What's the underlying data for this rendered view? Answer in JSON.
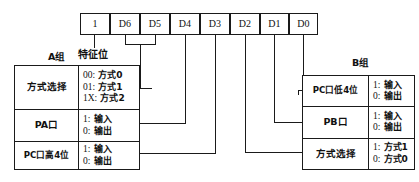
{
  "diagram": {
    "title_note": "8255A control word format diagram",
    "control_word": {
      "name": "control-word-bits",
      "cells": [
        {
          "id": "bit7",
          "label": "1"
        },
        {
          "id": "bit6",
          "label": "D6"
        },
        {
          "id": "bit5",
          "label": "D5"
        },
        {
          "id": "bit4",
          "label": "D4"
        },
        {
          "id": "bit3",
          "label": "D3"
        },
        {
          "id": "bit2",
          "label": "D2"
        },
        {
          "id": "bit1",
          "label": "D1"
        },
        {
          "id": "bit0",
          "label": "D0"
        }
      ]
    },
    "feature_bit_label": "特征位",
    "group_a": {
      "heading": "A组",
      "rows": [
        {
          "name": "方式选择",
          "values": [
            {
              "code": "00:",
              "text": "方式0"
            },
            {
              "code": "01:",
              "text": "方式1"
            },
            {
              "code": "1X:",
              "text": "方式2"
            }
          ]
        },
        {
          "name": "PA口",
          "values": [
            {
              "code": "1:",
              "text": "输入"
            },
            {
              "code": "0:",
              "text": "输出"
            }
          ]
        },
        {
          "name": "PC口高4位",
          "values": [
            {
              "code": "1:",
              "text": "输入"
            },
            {
              "code": "0:",
              "text": "输出"
            }
          ]
        }
      ]
    },
    "group_b": {
      "heading": "B组",
      "rows": [
        {
          "name": "PC口低4位",
          "values": [
            {
              "code": "1:",
              "text": "输入"
            },
            {
              "code": "0:",
              "text": "输出"
            }
          ]
        },
        {
          "name": "PB口",
          "values": [
            {
              "code": "1:",
              "text": "输入"
            },
            {
              "code": "0:",
              "text": "输出"
            }
          ]
        },
        {
          "name": "方式选择",
          "values": [
            {
              "code": "1:",
              "text": "方式1"
            },
            {
              "code": "0:",
              "text": "方式0"
            }
          ]
        }
      ]
    },
    "colors": {
      "line": "#1a1a1a",
      "background": "#ffffff",
      "text": "#111111"
    }
  }
}
